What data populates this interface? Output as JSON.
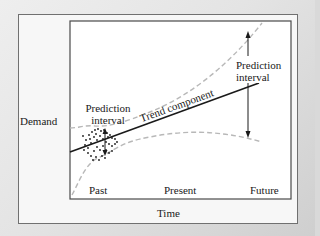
{
  "diagram": {
    "y_axis_label": "Demand",
    "x_axis_label": "Time",
    "x_ticks": [
      "Past",
      "Present",
      "Future"
    ],
    "annotations": {
      "left_interval_line1": "Prediction",
      "left_interval_line2": "interval",
      "right_interval_line1": "Prediction",
      "right_interval_line2": "interval",
      "trend": "Trend component"
    },
    "colors": {
      "frame": "#707070",
      "plot_border": "#4a4a4a",
      "trend_line": "#1a1a1a",
      "interval_band": "#b8b8b8",
      "data_points": "#1a1a1a",
      "background": "#f7f7f7"
    }
  }
}
